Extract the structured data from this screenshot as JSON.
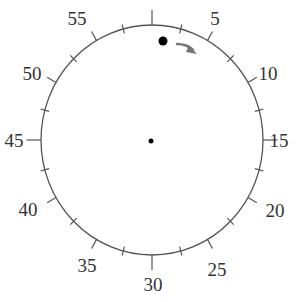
{
  "diagram": {
    "type": "clock-dial",
    "center": {
      "x": 152,
      "y": 140
    },
    "radius_x": 111,
    "radius_y": 115,
    "outline_color": "#555555",
    "minor_tick_count": 60,
    "labels": [
      {
        "text": "5",
        "angle_min": 5
      },
      {
        "text": "10",
        "angle_min": 10
      },
      {
        "text": "15",
        "angle_min": 15
      },
      {
        "text": "20",
        "angle_min": 20
      },
      {
        "text": "25",
        "angle_min": 25
      },
      {
        "text": "30",
        "angle_min": 30
      },
      {
        "text": "35",
        "angle_min": 35
      },
      {
        "text": "40",
        "angle_min": 40
      },
      {
        "text": "45",
        "angle_min": 45
      },
      {
        "text": "50",
        "angle_min": 50
      },
      {
        "text": "55",
        "angle_min": 55
      }
    ],
    "moving_point": {
      "x": 163,
      "y": 41,
      "r": 4.5,
      "color": "#000000"
    },
    "direction_arrow": {
      "color": "#777777",
      "direction": "clockwise"
    },
    "center_point": {
      "x": 151,
      "y": 141,
      "r": 2.5,
      "color": "#000000"
    }
  }
}
